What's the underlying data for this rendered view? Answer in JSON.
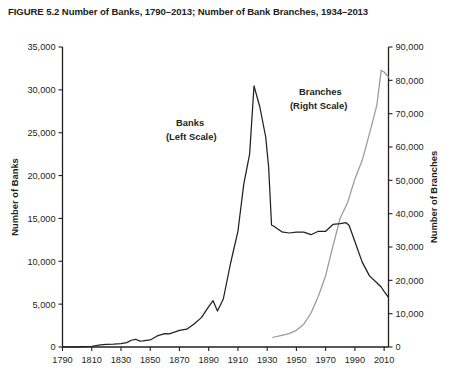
{
  "figure": {
    "label": "FIGURE 5.2",
    "title": "FIGURE 5.2  Number of Banks, 1790–2013; Number of Bank Branches, 1934–2013"
  },
  "colors": {
    "banks_line": "#231f20",
    "branches_line": "#9a9a9a",
    "axis": "#231f20",
    "background": "#ffffff"
  },
  "annotations": {
    "banks_label_line1": "Banks",
    "banks_label_line2": "(Left Scale)",
    "branches_label_line1": "Branches",
    "branches_label_line2": "(Right Scale)"
  },
  "chart_data": {
    "type": "line",
    "title": "FIGURE 5.2  Number of Banks, 1790–2013; Number of Bank Branches, 1934–2013",
    "xlabel": "",
    "ylabel": "Number of Banks",
    "y2label": "Number of Branches",
    "xlim": [
      1790,
      2013
    ],
    "ylim": [
      0,
      35000
    ],
    "y2lim": [
      0,
      90000
    ],
    "grid": false,
    "legend_position": "inline-annotations",
    "xticks": [
      1790,
      1810,
      1830,
      1850,
      1870,
      1890,
      1910,
      1930,
      1950,
      1970,
      1990,
      2010
    ],
    "xtick_labels": [
      "1790",
      "1810",
      "1830",
      "1850",
      "1870",
      "1890",
      "1910",
      "1930",
      "1950",
      "1970",
      "1990",
      "2010"
    ],
    "yticks": [
      0,
      5000,
      10000,
      15000,
      20000,
      25000,
      30000,
      35000
    ],
    "ytick_labels": [
      "0",
      "5,000",
      "10,000",
      "15,000",
      "20,000",
      "25,000",
      "30,000",
      "35,000"
    ],
    "y2ticks": [
      0,
      10000,
      20000,
      30000,
      40000,
      50000,
      60000,
      70000,
      80000,
      90000
    ],
    "y2tick_labels": [
      "0",
      "10,000",
      "20,000",
      "30,000",
      "40,000",
      "50,000",
      "60,000",
      "70,000",
      "80,000",
      "90,000"
    ],
    "series": [
      {
        "name": "Banks (Left Scale)",
        "axis": "left",
        "color": "#231f20",
        "x": [
          1790,
          1800,
          1810,
          1816,
          1820,
          1825,
          1830,
          1834,
          1837,
          1840,
          1843,
          1845,
          1850,
          1855,
          1857,
          1860,
          1863,
          1865,
          1870,
          1875,
          1880,
          1885,
          1890,
          1893,
          1896,
          1900,
          1905,
          1910,
          1914,
          1918,
          1921,
          1925,
          1929,
          1931,
          1933,
          1934,
          1937,
          1940,
          1945,
          1950,
          1955,
          1960,
          1965,
          1970,
          1975,
          1980,
          1984,
          1986,
          1990,
          1995,
          2000,
          2005,
          2008,
          2010,
          2013
        ],
        "y": [
          4,
          28,
          88,
          246,
          307,
          330,
          381,
          506,
          788,
          901,
          691,
          707,
          824,
          1307,
          1416,
          1562,
          1532,
          1643,
          1937,
          2076,
          2688,
          3427,
          4717,
          5400,
          4200,
          5600,
          9800,
          13500,
          19000,
          22500,
          30456,
          28000,
          24500,
          21000,
          14207,
          14146,
          13800,
          13438,
          13300,
          13400,
          13400,
          13100,
          13500,
          13500,
          14300,
          14400,
          14500,
          14200,
          12300,
          9900,
          8300,
          7500,
          7000,
          6500,
          5800
        ]
      },
      {
        "name": "Branches (Right Scale)",
        "axis": "right",
        "color": "#9a9a9a",
        "x": [
          1934,
          1935,
          1940,
          1945,
          1950,
          1955,
          1960,
          1965,
          1970,
          1975,
          1980,
          1985,
          1990,
          1995,
          2000,
          2005,
          2008,
          2010,
          2013
        ],
        "y": [
          2900,
          3000,
          3500,
          4000,
          5000,
          6800,
          10200,
          15200,
          21400,
          30300,
          38700,
          43300,
          50400,
          56000,
          64000,
          72500,
          83000,
          82500,
          81000
        ]
      }
    ]
  }
}
